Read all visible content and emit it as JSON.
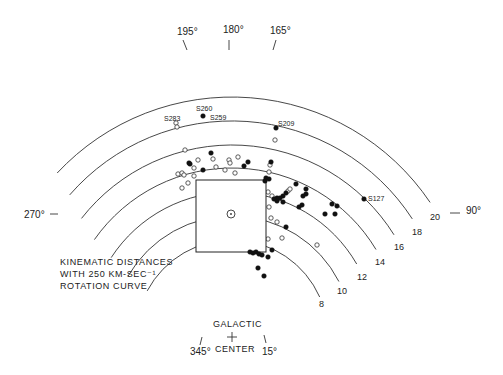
{
  "figure": {
    "center_gc": {
      "x": 232,
      "y": 336
    },
    "px_per_kpc": 11.95,
    "longitude_labels": [
      {
        "text": "195°",
        "x": 177,
        "y": 35,
        "tick": [
          183,
          40,
          187,
          50
        ]
      },
      {
        "text": "180°",
        "x": 223,
        "y": 33,
        "tick": [
          229,
          40,
          229,
          50
        ]
      },
      {
        "text": "165°",
        "x": 270,
        "y": 34,
        "tick": [
          276,
          40,
          273,
          50
        ]
      },
      {
        "text": "270°",
        "x": 24,
        "y": 218,
        "tick": [
          50,
          214,
          58,
          214
        ]
      },
      {
        "text": "90°",
        "x": 466,
        "y": 214,
        "tick": [
          450,
          213,
          460,
          213
        ]
      },
      {
        "text": "345°",
        "x": 190,
        "y": 355,
        "tick": [
          202,
          337,
          200,
          345
        ]
      },
      {
        "text": "15°",
        "x": 262,
        "y": 355,
        "tick": [
          264,
          335,
          266,
          343
        ]
      }
    ],
    "distance_arcs": [
      {
        "kpc": "8",
        "r": 96,
        "a_start": 24,
        "a_end": 152,
        "label_x": 319,
        "label_y": 307
      },
      {
        "kpc": "10",
        "r": 120,
        "a_start": 27,
        "a_end": 150,
        "label_x": 337,
        "label_y": 294
      },
      {
        "kpc": "12",
        "r": 144,
        "a_start": 30,
        "a_end": 147,
        "label_x": 357,
        "label_y": 280
      },
      {
        "kpc": "14",
        "r": 168,
        "a_start": 31,
        "a_end": 145,
        "label_x": 375,
        "label_y": 265
      },
      {
        "kpc": "16",
        "r": 191,
        "a_start": 32,
        "a_end": 142,
        "label_x": 394,
        "label_y": 250
      },
      {
        "kpc": "18",
        "r": 215,
        "a_start": 33,
        "a_end": 139,
        "label_x": 412,
        "label_y": 235
      },
      {
        "kpc": "20",
        "r": 239,
        "a_start": 34,
        "a_end": 137,
        "label_x": 430,
        "label_y": 220
      }
    ],
    "sun_box": {
      "x": 196,
      "y": 180,
      "w": 70,
      "h": 72
    },
    "sun": {
      "x": 231,
      "y": 214
    },
    "galactic_center": {
      "label_top": "GALACTIC",
      "label_bottom": "CENTER",
      "plus": "+"
    },
    "source_labels": [
      {
        "text": "S260",
        "x": 196,
        "y": 111
      },
      {
        "text": "S259",
        "x": 210,
        "y": 120
      },
      {
        "text": "S283",
        "x": 164,
        "y": 121
      },
      {
        "text": "S209",
        "x": 278,
        "y": 126
      },
      {
        "text": "S127",
        "x": 368,
        "y": 201
      }
    ],
    "note": [
      "KINEMATIC DISTANCES",
      "WITH 250 KM-SEC⁻¹",
      "ROTATION CURVE"
    ],
    "filled_points": [
      [
        203,
        116
      ],
      [
        276,
        128
      ],
      [
        364,
        199
      ],
      [
        211,
        153
      ],
      [
        189,
        163
      ],
      [
        190,
        164
      ],
      [
        203,
        170
      ],
      [
        244,
        166
      ],
      [
        248,
        162
      ],
      [
        271,
        162
      ],
      [
        269,
        179
      ],
      [
        266,
        178
      ],
      [
        265,
        181
      ],
      [
        296,
        184
      ],
      [
        306,
        189
      ],
      [
        306,
        194
      ],
      [
        303,
        196
      ],
      [
        286,
        193
      ],
      [
        283,
        196
      ],
      [
        280,
        198
      ],
      [
        277,
        198
      ],
      [
        274,
        199
      ],
      [
        277,
        201
      ],
      [
        283,
        202
      ],
      [
        302,
        205
      ],
      [
        299,
        207
      ],
      [
        332,
        204
      ],
      [
        337,
        206
      ],
      [
        325,
        214
      ],
      [
        335,
        214
      ],
      [
        286,
        227
      ],
      [
        272,
        250
      ],
      [
        250,
        252
      ],
      [
        253,
        253
      ],
      [
        256,
        252
      ],
      [
        259,
        254
      ],
      [
        262,
        255
      ],
      [
        268,
        257
      ],
      [
        258,
        268
      ],
      [
        264,
        276
      ]
    ],
    "open_points": [
      [
        176,
        123
      ],
      [
        177,
        127
      ],
      [
        275,
        140
      ],
      [
        185,
        150
      ],
      [
        198,
        160
      ],
      [
        213,
        159
      ],
      [
        229,
        160
      ],
      [
        230,
        163
      ],
      [
        238,
        157
      ],
      [
        178,
        174
      ],
      [
        182,
        173
      ],
      [
        184,
        175
      ],
      [
        194,
        176
      ],
      [
        194,
        168
      ],
      [
        216,
        167
      ],
      [
        225,
        170
      ],
      [
        235,
        173
      ],
      [
        269,
        172
      ],
      [
        270,
        165
      ],
      [
        182,
        188
      ],
      [
        188,
        183
      ],
      [
        268,
        192
      ],
      [
        272,
        196
      ],
      [
        288,
        191
      ],
      [
        290,
        189
      ],
      [
        269,
        207
      ],
      [
        271,
        218
      ],
      [
        277,
        222
      ],
      [
        282,
        238
      ],
      [
        268,
        239
      ],
      [
        317,
        245
      ]
    ]
  }
}
